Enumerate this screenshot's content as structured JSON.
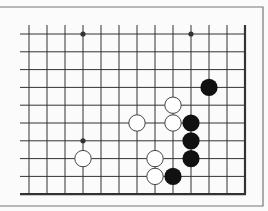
{
  "diagram": {
    "type": "go-board-fragment",
    "columns": 13,
    "rows": 10,
    "open_edges": [
      "left",
      "top"
    ],
    "closed_edges": [
      "right",
      "bottom"
    ],
    "hoshi": [
      [
        3,
        0
      ],
      [
        9,
        0
      ],
      [
        3,
        6
      ]
    ],
    "stones": {
      "black": [
        [
          10,
          3
        ],
        [
          9,
          5
        ],
        [
          9,
          6
        ],
        [
          9,
          7
        ],
        [
          8,
          8
        ]
      ],
      "white": [
        [
          8,
          4
        ],
        [
          6,
          5
        ],
        [
          8,
          5
        ],
        [
          7,
          7
        ],
        [
          7,
          8
        ],
        [
          3,
          7
        ]
      ]
    },
    "colors": {
      "background": "#fbfbfb",
      "line": "#333333",
      "frame": "#777777",
      "black_stone": "#111111",
      "white_stone": "#ffffff"
    }
  }
}
